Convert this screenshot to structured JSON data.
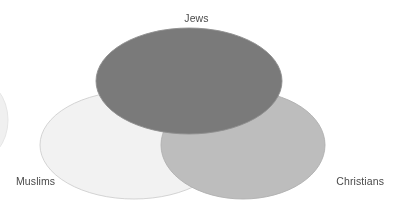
{
  "diagram": {
    "type": "venn",
    "set_count": 3,
    "background_color": "#ffffff",
    "label_color": "#4a4a4a",
    "sets": [
      {
        "id": "jews",
        "label": "Jews",
        "label_position": "top-center",
        "fill_color": "#7a7a7a",
        "stroke_color": "#8e8e8e",
        "cx": 189,
        "cy": 81,
        "rx": 93,
        "ry": 53
      },
      {
        "id": "muslims",
        "label": "Muslims",
        "label_position": "bottom-left",
        "fill_color": "#f2f2f2",
        "stroke_color": "#cfcfcf",
        "cx": 134,
        "cy": 145,
        "rx": 94,
        "ry": 54
      },
      {
        "id": "christians",
        "label": "Christians",
        "label_position": "bottom-right",
        "fill_color": "#bdbdbd",
        "stroke_color": "#b0b0b0",
        "cx": 243,
        "cy": 145,
        "rx": 82,
        "ry": 54
      }
    ],
    "edge_artifact": {
      "id": "left-edge-arc",
      "color": "#f0f0f0",
      "cx": -26,
      "cy": 120,
      "rx": 34,
      "ry": 42
    }
  }
}
